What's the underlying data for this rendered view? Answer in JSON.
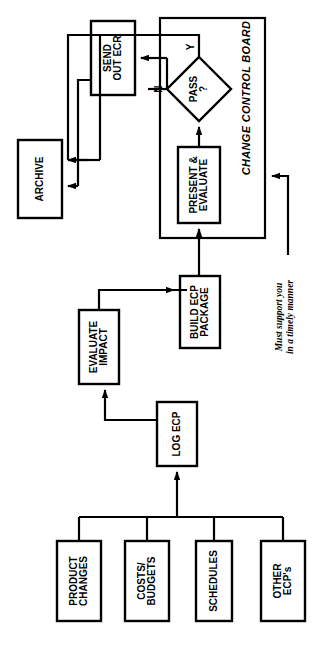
{
  "diagram": {
    "orientation": "rotated-90-counterclockwise",
    "colors": {
      "stroke": "#000000",
      "fill": "#ffffff",
      "background": "#ffffff"
    },
    "group": {
      "label": "CHANGE CONTROL BOARD"
    },
    "note": {
      "line1": "Must support you",
      "line2": "in a timely manner"
    },
    "nodes": [
      {
        "id": "product_changes",
        "label": "PRODUCT\nCHANGES",
        "shape": "rect"
      },
      {
        "id": "costs_budgets",
        "label": "COSTS/\nBUDGETS",
        "shape": "rect"
      },
      {
        "id": "schedules",
        "label": "SCHEDULES",
        "shape": "rect"
      },
      {
        "id": "other_ecps",
        "label": "OTHER\nECP's",
        "shape": "rect"
      },
      {
        "id": "log_ecp",
        "label": "LOG ECP",
        "shape": "rect"
      },
      {
        "id": "evaluate_impact",
        "label": "EVALUATE\nIMPACT",
        "shape": "rect"
      },
      {
        "id": "build_ecp",
        "label": "BUILD ECP\nPACKAGE",
        "shape": "rect"
      },
      {
        "id": "present_eval",
        "label": "PRESENT &\nEVALUATE",
        "shape": "rect"
      },
      {
        "id": "pass",
        "label": "PASS\n?",
        "shape": "diamond"
      },
      {
        "id": "send_out_ecr",
        "label": "SEND\nOUT ECR",
        "shape": "rect"
      },
      {
        "id": "archive",
        "label": "ARCHIVE",
        "shape": "rect"
      }
    ],
    "branches": [
      {
        "id": "yes",
        "label": "Y",
        "from": "pass",
        "to": "archive"
      },
      {
        "id": "no",
        "label": "N",
        "from": "pass",
        "to": "send_out_ecr"
      }
    ],
    "edges": [
      {
        "from": "product_changes",
        "to": "log_ecp"
      },
      {
        "from": "costs_budgets",
        "to": "log_ecp"
      },
      {
        "from": "schedules",
        "to": "log_ecp"
      },
      {
        "from": "other_ecps",
        "to": "log_ecp"
      },
      {
        "from": "log_ecp",
        "to": "evaluate_impact"
      },
      {
        "from": "evaluate_impact",
        "to": "build_ecp"
      },
      {
        "from": "build_ecp",
        "to": "present_eval"
      },
      {
        "from": "present_eval",
        "to": "pass"
      },
      {
        "from": "send_out_ecr",
        "to": "archive"
      },
      {
        "from": "note",
        "to": "change_control_board"
      }
    ]
  }
}
